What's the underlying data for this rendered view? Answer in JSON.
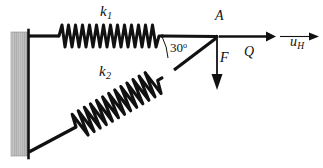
{
  "figure": {
    "kind": "mechanics-free-body-diagram",
    "background_color": "#ffffff",
    "ink_color": "#111111",
    "wall_color": "#b3b3b3"
  },
  "labels": {
    "spring_top": {
      "symbol": "k",
      "subscript": "1",
      "text": "k1"
    },
    "spring_bottom": {
      "symbol": "k",
      "subscript": "2",
      "text": "k2"
    },
    "joint": {
      "text": "A"
    },
    "force_vertical": {
      "text": "F"
    },
    "force_horizontal": {
      "text": "Q"
    },
    "displacement": {
      "symbol": "u",
      "subscript": "H",
      "text": "uH"
    },
    "angle": {
      "value": "30",
      "unit": "o",
      "text": "30o"
    }
  },
  "geometry": {
    "wall": {
      "x": 11,
      "y": 32,
      "width": 17,
      "height": 124
    },
    "wall_face_line": {
      "x": 28,
      "y1": 30,
      "y2": 158
    },
    "point_A": {
      "x": 216,
      "y": 37
    },
    "top_anchor": {
      "x": 28,
      "y": 36
    },
    "bottom_anchor": {
      "x": 30,
      "y": 152
    },
    "angle_arc_radius": 38,
    "spring_top": {
      "x1": 58,
      "x2": 163,
      "coils": 15,
      "amplitude": 12
    },
    "spring_bottom": {
      "x1": 74,
      "y1": 129,
      "x2": 172,
      "y2": 73,
      "coils": 16,
      "amplitude": 13
    },
    "arrow_Q": {
      "x1": 219,
      "y1": 36,
      "x2": 272,
      "y2": 36
    },
    "arrow_uH": {
      "x1": 278,
      "y1": 36,
      "x2": 317,
      "y2": 36
    },
    "arrow_F": {
      "x1": 217,
      "y1": 39,
      "x2": 217,
      "y2": 88
    }
  }
}
